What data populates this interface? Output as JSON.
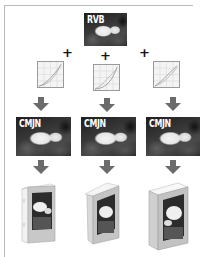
{
  "diagram": {
    "source": {
      "label": "RVB",
      "icon": "rgb-photo"
    },
    "operators": [
      "+",
      "+",
      "+"
    ],
    "branches": [
      {
        "profile_icon": "tone-curve-icon",
        "output_label": "CMJN",
        "product": "softcover-book-icon"
      },
      {
        "profile_icon": "tone-curve-icon",
        "output_label": "CMJN",
        "product": "paperback-book-icon"
      },
      {
        "profile_icon": "tone-curve-icon",
        "output_label": "CMJN",
        "product": "hardcover-book-icon"
      }
    ],
    "colors": {
      "arrow": "#6b6b6b",
      "frame": "#b9b9b9",
      "curve_grid": "#c8c8c8",
      "curve_line": "#8a8a8a"
    }
  }
}
